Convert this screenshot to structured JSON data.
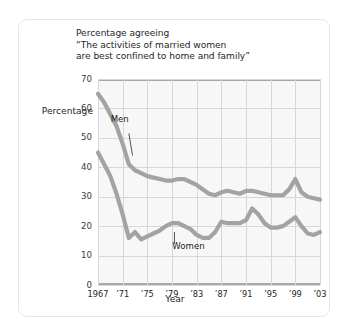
{
  "chart_data": {
    "type": "line",
    "title": "Percentage agreeing\n“The activities of married women\nare best confined to home and family”",
    "xlabel": "Year",
    "ylabel": "Percentage",
    "xlim": [
      1967,
      2003
    ],
    "ylim": [
      0,
      70
    ],
    "ytick_values": [
      70,
      60,
      50,
      40,
      30,
      20,
      10,
      0
    ],
    "ytick_labels": [
      "70",
      "60",
      "50",
      "40",
      "30",
      "20",
      "10",
      "0"
    ],
    "xtick_values": [
      1967,
      1971,
      1975,
      1979,
      1983,
      1987,
      1991,
      1995,
      1999,
      2003
    ],
    "xtick_labels": [
      "1967",
      "’71",
      "’75",
      "’79",
      "’83",
      "’87",
      "’91",
      "’95",
      "’99",
      "’03"
    ],
    "grid": true,
    "legend": "inline-annotations",
    "line_color": "#a3a3a3",
    "plot_background": "#f7f7f7",
    "grid_color": "#d7d7d7",
    "axis_color": "#a8a8a8",
    "series": [
      {
        "name": "Men",
        "annotation_label": "Men",
        "x": [
          1967,
          1968,
          1969,
          1970,
          1971,
          1972,
          1973,
          1974,
          1975,
          1976,
          1977,
          1978,
          1979,
          1980,
          1981,
          1982,
          1983,
          1984,
          1985,
          1986,
          1987,
          1988,
          1989,
          1990,
          1991,
          1992,
          1993,
          1994,
          1995,
          1996,
          1997,
          1998,
          1999,
          2000,
          2001,
          2002,
          2003
        ],
        "values": [
          65,
          62,
          58,
          54,
          48,
          41,
          39,
          38,
          37,
          36.5,
          36,
          35.5,
          35.5,
          36,
          36,
          35,
          34,
          32.5,
          31,
          30.5,
          31.5,
          32,
          31.5,
          31,
          32,
          32,
          31.5,
          31,
          30.5,
          30.5,
          30.5,
          32.5,
          36,
          31.5,
          30,
          29.5,
          29
        ]
      },
      {
        "name": "Women",
        "annotation_label": "Women",
        "x": [
          1967,
          1968,
          1969,
          1970,
          1971,
          1972,
          1973,
          1974,
          1975,
          1976,
          1977,
          1978,
          1979,
          1980,
          1981,
          1982,
          1983,
          1984,
          1985,
          1986,
          1987,
          1988,
          1989,
          1990,
          1991,
          1992,
          1993,
          1994,
          1995,
          1996,
          1997,
          1998,
          1999,
          2000,
          2001,
          2002,
          2003
        ],
        "values": [
          45,
          41,
          37,
          31,
          24,
          16,
          18,
          15.5,
          16.5,
          17.5,
          18.5,
          20,
          21,
          21,
          20,
          19,
          17,
          16,
          16,
          18,
          21.5,
          21,
          21,
          21,
          22,
          26,
          24,
          21,
          19.5,
          19.5,
          20,
          21.5,
          23,
          20,
          17.5,
          17,
          18
        ]
      }
    ],
    "annotations": [
      {
        "text": "Men",
        "for_series": "Men",
        "x_label_pos": 1971,
        "y_label_pos": 56
      },
      {
        "text": "Women",
        "for_series": "Women",
        "x_label_pos": 1981,
        "y_label_pos": 13
      }
    ]
  }
}
